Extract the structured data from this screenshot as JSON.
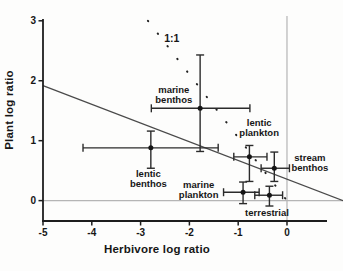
{
  "chart_data": {
    "type": "scatter",
    "title": "",
    "xlabel": "Herbivore log ratio",
    "ylabel": "Plant log ratio",
    "xlim": [
      -5,
      0.82
    ],
    "ylim": [
      -0.34,
      3.03
    ],
    "x_ticks": [
      -5,
      -4,
      -3,
      -2,
      -1,
      0
    ],
    "y_ticks": [
      0,
      1,
      2,
      3
    ],
    "grid": "off",
    "legend": "none",
    "reference_lines": {
      "vertical_at_x": 0,
      "horizontal_at_y": 0
    },
    "one_to_one_line": {
      "label": "1:1",
      "style": "dotted",
      "from": {
        "x": -2.85,
        "y": 3.0
      },
      "to": {
        "x": 0.0,
        "y": 0.0
      },
      "label_x": -2.36,
      "label_y": 2.7
    },
    "regression_line": {
      "style": "solid",
      "slope": -0.31,
      "intercept": 0.36,
      "from": {
        "x": -5.0,
        "y": 1.92
      },
      "to": {
        "x": 1.15,
        "y": 0.0
      }
    },
    "points": [
      {
        "name": "marine benthos",
        "x": -1.78,
        "y": 1.54,
        "x_lo": -2.78,
        "x_hi": -0.76,
        "y_lo": 0.82,
        "y_hi": 2.43,
        "label_lines": [
          "marine",
          "benthos"
        ],
        "label_x": -2.32,
        "label_y": 1.76
      },
      {
        "name": "lentic benthos",
        "x": -2.79,
        "y": 0.88,
        "x_lo": -4.18,
        "x_hi": -1.41,
        "y_lo": 0.54,
        "y_hi": 1.16,
        "label_lines": [
          "lentic",
          "benthos"
        ],
        "label_x": -2.84,
        "label_y": 0.36
      },
      {
        "name": "lentic plankton",
        "x": -0.77,
        "y": 0.73,
        "x_lo": -1.09,
        "x_hi": -0.41,
        "y_lo": 0.32,
        "y_hi": 0.92,
        "label_lines": [
          "lentic",
          "plankton"
        ],
        "label_x": -0.57,
        "label_y": 1.21
      },
      {
        "name": "stream benthos",
        "x": -0.26,
        "y": 0.54,
        "x_lo": -0.53,
        "x_hi": 0.05,
        "y_lo": 0.32,
        "y_hi": 0.81,
        "label_lines": [
          "stream",
          "benthos"
        ],
        "label_x": 0.47,
        "label_y": 0.63
      },
      {
        "name": "marine plankton",
        "x": -0.9,
        "y": 0.14,
        "x_lo": -1.3,
        "x_hi": -0.57,
        "y_lo": -0.05,
        "y_hi": 0.31,
        "label_lines": [
          "marine",
          "plankton"
        ],
        "label_x": -1.81,
        "label_y": 0.18
      },
      {
        "name": "terrestrial",
        "x": -0.36,
        "y": 0.09,
        "x_lo": -0.66,
        "x_hi": -0.09,
        "y_lo": -0.09,
        "y_hi": 0.24,
        "label_lines": [
          "terrestrial"
        ],
        "label_x": -0.41,
        "label_y": -0.2
      }
    ],
    "colors": {
      "point": "#151515",
      "error_bar": "#2b2b2b",
      "regression_line": "#4a4a4a",
      "one_to_one_dots": "#222222",
      "axis": "#1d1d1d",
      "reference": "#b5b5b5",
      "text": "#161616",
      "background": "#fdfdfc"
    }
  }
}
